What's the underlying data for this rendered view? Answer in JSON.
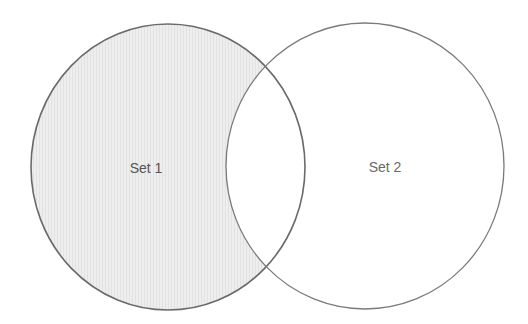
{
  "diagram": {
    "type": "venn",
    "sets": [
      {
        "label": "Set 1",
        "shaded": true,
        "fill": "#ececec",
        "stroke": "#666666",
        "text_color": "#555555"
      },
      {
        "label": "Set 2",
        "shaded": false,
        "fill": "#ffffff",
        "stroke": "#777777",
        "text_color": "#666666"
      }
    ],
    "shaded_region": "Set 1 minus Set 2",
    "background": "#ffffff"
  }
}
